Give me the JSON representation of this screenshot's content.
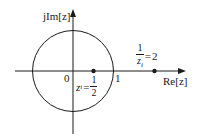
{
  "diagram": {
    "type": "z-plane pole diagram",
    "axes": {
      "imag_label": "jIm[z]",
      "real_label": "Re[z]",
      "origin_label": "0",
      "unit_tick_label": "1"
    },
    "unit_circle": {
      "radius": 1
    },
    "points": [
      {
        "name": "z_i",
        "value": 0.5,
        "label_lhs": "z",
        "label_sub": "i",
        "label_eq": "=",
        "label_num": "1",
        "label_den": "2"
      },
      {
        "name": "1/z_i",
        "value": 2,
        "label_num": "1",
        "label_den_var": "z",
        "label_den_sub": "i",
        "label_eq": "=",
        "label_rhs": "2"
      }
    ],
    "colors": {
      "stroke": "#1a1a1a",
      "background": "#ffffff"
    }
  }
}
